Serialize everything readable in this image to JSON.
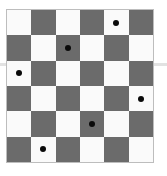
{
  "board": {
    "rows": 6,
    "cols": 6,
    "colors": {
      "light": "#fafafa",
      "dark": "#6b6b6b",
      "dot": "#0a0a0a"
    },
    "first_cell": "light",
    "pieces": [
      {
        "row": 0,
        "col": 4
      },
      {
        "row": 1,
        "col": 2
      },
      {
        "row": 2,
        "col": 0
      },
      {
        "row": 3,
        "col": 5
      },
      {
        "row": 4,
        "col": 3
      },
      {
        "row": 5,
        "col": 1
      }
    ]
  }
}
